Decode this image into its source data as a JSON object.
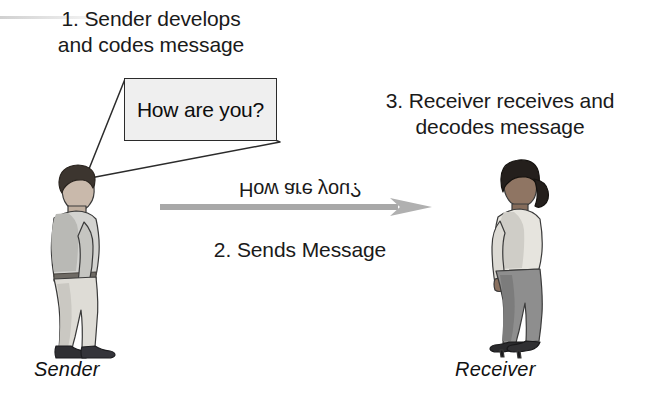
{
  "diagram": {
    "steps": [
      {
        "id": "step1",
        "text": "1. Sender develops\nand codes message"
      },
      {
        "id": "step2",
        "text": "2. Sends Message"
      },
      {
        "id": "step3",
        "text": "3. Receiver receives and\ndecodes message"
      }
    ],
    "speech_bubble": {
      "text": "How are you?",
      "fill_color": "#efefef",
      "border_color": "#2b2b2b"
    },
    "encoded_message": {
      "text": "How are you?",
      "orientation": "vertically-mirrored"
    },
    "arrow": {
      "direction": "left-to-right",
      "color": "#a8a8a8"
    },
    "actors": [
      {
        "id": "sender",
        "caption": "Sender",
        "facing": "right",
        "hair_color": "#3c352f",
        "shirt_color": "#d3d3d0",
        "trousers_color": "#dedcd6",
        "shoes_color": "#2f2f33"
      },
      {
        "id": "receiver",
        "caption": "Receiver",
        "facing": "left",
        "hair_color": "#241f1c",
        "blouse_color": "#e6e4de",
        "trousers_color": "#8e8e8e",
        "shoes_color": "#2a2a2d"
      }
    ]
  }
}
